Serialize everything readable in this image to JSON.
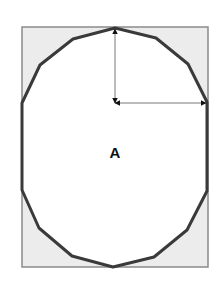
{
  "diagram": {
    "label": "A",
    "label_pos": [
      115,
      152
    ],
    "rect": {
      "x": 22,
      "y": 27,
      "w": 186,
      "h": 240,
      "fill": "#ececec",
      "stroke": "#8a8a8a"
    },
    "polygon": {
      "points": [
        [
          115,
          28
        ],
        [
          156,
          38
        ],
        [
          188,
          64
        ],
        [
          207,
          102
        ],
        [
          207,
          191
        ],
        [
          187,
          230
        ],
        [
          154,
          257
        ],
        [
          113,
          267
        ],
        [
          72,
          256
        ],
        [
          39,
          228
        ],
        [
          22,
          190
        ],
        [
          22,
          103
        ],
        [
          40,
          65
        ],
        [
          73,
          39
        ]
      ],
      "stroke": "#3a3a3a",
      "fill": "#ffffff"
    },
    "center": [
      115,
      103
    ],
    "arrows": [
      {
        "name": "vertical-radius-arrow",
        "from": [
          115,
          103
        ],
        "to": [
          115,
          29
        ]
      },
      {
        "name": "horizontal-radius-arrow",
        "from": [
          115,
          103
        ],
        "to": [
          206,
          103
        ]
      }
    ]
  }
}
